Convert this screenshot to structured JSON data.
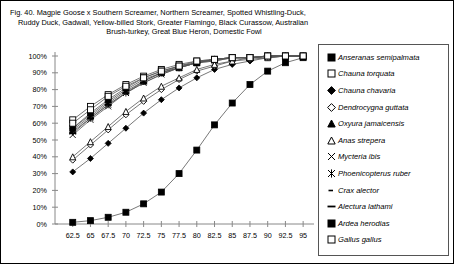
{
  "caption": {
    "line1": "Fig. 40.  Magpie Goose x Southern Screamer, Northern Screamer, Spotted Whistling-Duck,",
    "line2": "Ruddy Duck, Gadwall, Yellow-billed Stork, Greater Flamingo, Black Curassow, Australian",
    "line3": "Brush-turkey, Great Blue Heron, Domestic Fowl"
  },
  "chart_data": {
    "type": "line",
    "xlabel": "",
    "ylabel": "",
    "xlim": [
      60,
      96.25
    ],
    "ylim": [
      0,
      100
    ],
    "grid": false,
    "legend_position": "right",
    "x": [
      62.5,
      65,
      67.5,
      70,
      72.5,
      75,
      77.5,
      80,
      82.5,
      85,
      87.5,
      90,
      92.5,
      95
    ],
    "xtick_labels": [
      "62.5",
      "65",
      "67.5",
      "70",
      "72.5",
      "75",
      "77.5",
      "80",
      "82.5",
      "85",
      "87.5",
      "90",
      "92.5",
      "95"
    ],
    "ytick_labels": [
      "0%",
      "10%",
      "20%",
      "30%",
      "40%",
      "50%",
      "60%",
      "70%",
      "80%",
      "90%",
      "100%"
    ],
    "ytick_values": [
      0,
      10,
      20,
      30,
      40,
      50,
      60,
      70,
      80,
      90,
      100
    ],
    "series": [
      {
        "name": "Anseranas semipalmata",
        "marker": "filled-square",
        "values": [
          1,
          2,
          4,
          7,
          12,
          19,
          30,
          44,
          59,
          72,
          83,
          91,
          96,
          99
        ]
      },
      {
        "name": "Chauna torquata",
        "marker": "open-square",
        "values": [
          62,
          70,
          77,
          83,
          88,
          92,
          95,
          97,
          98,
          99,
          99,
          100,
          100,
          100
        ]
      },
      {
        "name": "Chauna chavaria",
        "marker": "filled-diamond",
        "values": [
          31,
          39,
          48,
          57,
          66,
          74,
          81,
          87,
          92,
          95,
          97,
          99,
          100,
          100
        ]
      },
      {
        "name": "Dendrocygna guttata",
        "marker": "open-diamond",
        "values": [
          38,
          47,
          56,
          65,
          73,
          80,
          86,
          91,
          94,
          97,
          98,
          99,
          100,
          100
        ]
      },
      {
        "name": "Oxyura jamaicensis",
        "marker": "filled-triangle",
        "values": [
          56,
          64,
          72,
          79,
          85,
          90,
          93,
          96,
          98,
          99,
          99,
          100,
          100,
          100
        ]
      },
      {
        "name": "Anas strepera",
        "marker": "open-triangle",
        "values": [
          40,
          49,
          58,
          67,
          75,
          82,
          87,
          92,
          95,
          97,
          99,
          99,
          100,
          100
        ]
      },
      {
        "name": "Mycteria ibis",
        "marker": "x-cross",
        "values": [
          53,
          62,
          70,
          78,
          84,
          89,
          93,
          96,
          97,
          99,
          99,
          100,
          100,
          100
        ]
      },
      {
        "name": "Phoenicopterus ruber",
        "marker": "x-star",
        "values": [
          55,
          63,
          71,
          78,
          85,
          90,
          93,
          96,
          98,
          99,
          99,
          100,
          100,
          100
        ]
      },
      {
        "name": "Crax alector",
        "marker": "small-dash",
        "values": [
          57,
          65,
          73,
          80,
          86,
          90,
          94,
          96,
          98,
          99,
          99,
          100,
          100,
          100
        ]
      },
      {
        "name": "Alectura lathami",
        "marker": "long-dash",
        "values": [
          54,
          63,
          71,
          78,
          84,
          89,
          93,
          96,
          97,
          99,
          99,
          100,
          100,
          100
        ]
      },
      {
        "name": "Ardea herodias",
        "marker": "filled-square",
        "values": [
          57,
          66,
          74,
          81,
          87,
          91,
          94,
          96,
          98,
          99,
          99,
          100,
          100,
          100
        ]
      },
      {
        "name": "Gallus gallus",
        "marker": "open-square",
        "values": [
          60,
          68,
          76,
          82,
          87,
          91,
          94,
          97,
          98,
          99,
          99,
          100,
          100,
          100
        ]
      }
    ]
  },
  "legend": {
    "items": [
      {
        "label": "Anseranas semipalmata",
        "marker": "filled-square"
      },
      {
        "label": "Chauna torquata",
        "marker": "open-square"
      },
      {
        "label": "Chauna chavaria",
        "marker": "filled-diamond"
      },
      {
        "label": "Dendrocygna guttata",
        "marker": "open-diamond"
      },
      {
        "label": "Oxyura jamaicensis",
        "marker": "filled-triangle"
      },
      {
        "label": "Anas strepera",
        "marker": "open-triangle"
      },
      {
        "label": "Mycteria ibis",
        "marker": "x-cross"
      },
      {
        "label": "Phoenicopterus ruber",
        "marker": "x-star"
      },
      {
        "label": "Crax alector",
        "marker": "small-dash"
      },
      {
        "label": "Alectura lathami",
        "marker": "long-dash"
      },
      {
        "label": "Ardea herodias",
        "marker": "filled-square"
      },
      {
        "label": "Gallus gallus",
        "marker": "open-square"
      }
    ]
  }
}
